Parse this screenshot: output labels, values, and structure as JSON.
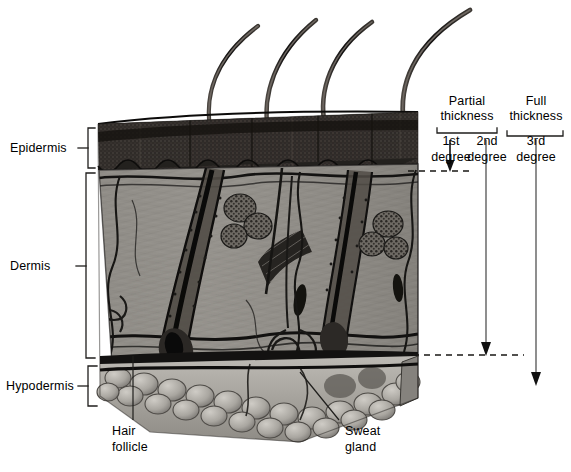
{
  "figure": {
    "type": "anatomical-illustration",
    "palette": {
      "background": "#ffffff",
      "ink": "#000000",
      "epidermis_dark": "#2a2724",
      "epidermis_mid": "#3d3a36",
      "dermis_mid": "#8e8b86",
      "dermis_light": "#a6a39e",
      "dermis_dark": "#4a4743",
      "hypodermis_fat": "#b2afa9",
      "hypodermis_shadow": "#6f6c67",
      "hair_dark": "#1c1a18",
      "leader_line": "#222222"
    }
  },
  "layer_labels": [
    {
      "id": "epidermis",
      "text": "Epidermis"
    },
    {
      "id": "dermis",
      "text": "Dermis"
    },
    {
      "id": "hypodermis",
      "text": "Hypodermis"
    }
  ],
  "structure_labels": [
    {
      "id": "hair-follicle",
      "line1": "Hair",
      "line2": "follicle"
    },
    {
      "id": "sweat-gland",
      "line1": "Sweat",
      "line2": "gland"
    }
  ],
  "burn_classification": {
    "groups": [
      {
        "id": "partial-thickness",
        "line1": "Partial",
        "line2": "thickness",
        "degrees": [
          {
            "id": "first-degree",
            "line1": "1st",
            "line2": "degree"
          },
          {
            "id": "second-degree",
            "line1": "2nd",
            "line2": "degree"
          }
        ]
      },
      {
        "id": "full-thickness",
        "line1": "Full",
        "line2": "thickness",
        "degrees": [
          {
            "id": "third-degree",
            "line1": "3rd",
            "line2": "degree"
          }
        ]
      }
    ]
  }
}
